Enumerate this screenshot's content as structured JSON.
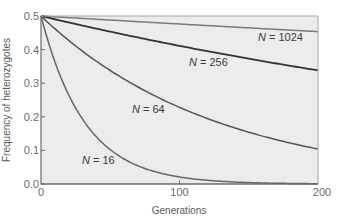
{
  "chart_data": {
    "type": "line",
    "title": "",
    "xlabel": "Generations",
    "ylabel": "Frequency of heterozygotes",
    "xlim": [
      0,
      200
    ],
    "ylim": [
      0.0,
      0.5
    ],
    "xticks": [
      0,
      100,
      200
    ],
    "xtick_labels": [
      "0",
      "100",
      "200"
    ],
    "yticks": [
      0.0,
      0.1,
      0.2,
      0.3,
      0.4,
      0.5
    ],
    "ytick_labels": [
      "0.0",
      "0.1",
      "0.2",
      "0.3",
      "0.4",
      "0.5"
    ],
    "grid": false,
    "legend": "inline labels",
    "x": [
      0,
      25,
      50,
      75,
      100,
      125,
      150,
      175,
      200
    ],
    "series": [
      {
        "name": "N = 1024",
        "N": 1024,
        "color": "#7a7a7a",
        "label_prefix": "N",
        "label_suffix": " = 1024",
        "values": [
          0.5,
          0.494,
          0.488,
          0.482,
          0.476,
          0.47,
          0.465,
          0.459,
          0.453
        ]
      },
      {
        "name": "N = 256",
        "N": 256,
        "color": "#333333",
        "label_prefix": "N",
        "label_suffix": " = 256",
        "values": [
          0.5,
          0.476,
          0.453,
          0.431,
          0.411,
          0.391,
          0.372,
          0.355,
          0.338
        ]
      },
      {
        "name": "N = 64",
        "N": 64,
        "color": "#555555",
        "label_prefix": "N",
        "label_suffix": " = 64",
        "values": [
          0.5,
          0.338,
          0.229,
          0.155,
          0.105,
          0.071,
          0.048,
          0.032,
          0.022
        ]
      },
      {
        "name": "N = 16",
        "N": 16,
        "color": "#666666",
        "label_prefix": "N",
        "label_suffix": " = 16",
        "values": [
          0.5,
          0.228,
          0.102,
          0.046,
          0.021,
          0.009,
          0.004,
          0.002,
          0.001
        ]
      }
    ],
    "note": "Curves follow H_t = 0.5 * (1 - 1/(2N))^t"
  },
  "colors": {
    "plot_background": "#ececec",
    "axis_dark": "#6a6a6a",
    "axis_light": "#a8a8a8"
  }
}
